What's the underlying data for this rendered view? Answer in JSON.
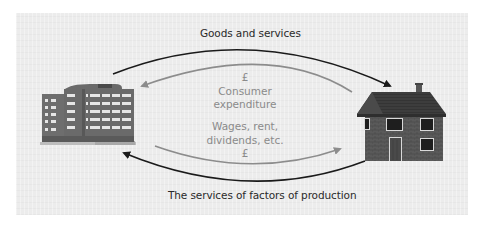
{
  "diagram": {
    "title_top": "Goods and services",
    "title_bottom": "The services of factors of production",
    "inner_top": {
      "currency": "£",
      "line1": "Consumer",
      "line2": "expenditure"
    },
    "inner_bottom": {
      "line1": "Wages, rent,",
      "line2": "dividends, etc.",
      "currency": "£"
    },
    "nodes": {
      "left": "firms-office-building",
      "right": "households-house"
    },
    "colors": {
      "outer_arrow": "#1a1a1a",
      "inner_arrow": "#8c8c8c",
      "panel": "#ececec",
      "inner_text": "#8a8a8a",
      "outer_text": "#2a2a2a"
    }
  }
}
